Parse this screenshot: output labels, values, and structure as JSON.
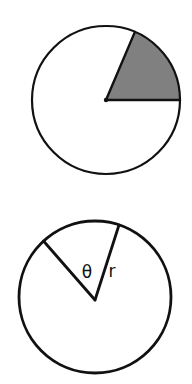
{
  "figure": {
    "background_color": "#ffffff",
    "stroke_color": "#111111",
    "shade_color": "#808080",
    "canvas": {
      "width": 192,
      "height": 384
    }
  },
  "diagrams": [
    {
      "name": "shaded-sector-circle",
      "description": "Circle with one shaded sector in the upper-right",
      "center": {
        "x": 106,
        "y": 100
      },
      "radius": 74,
      "stroke_width": 2.2,
      "sector": {
        "shaded": true,
        "fill_color": "#808080",
        "start_angle_deg": 0,
        "end_angle_deg": 67,
        "sweep_deg": 67,
        "radius_line_1": {
          "x2": 180,
          "y2": 100
        },
        "radius_line_2": {
          "x2": 135,
          "y2": 32
        }
      },
      "labels": []
    },
    {
      "name": "theta-radius-circle",
      "description": "Circle with two radii forming a central angle theta, one radius labelled r",
      "center": {
        "x": 95,
        "y": 297
      },
      "radius": 76,
      "stroke_width": 2.6,
      "sector": {
        "shaded": false,
        "start_angle_deg": 71,
        "end_angle_deg": 131,
        "sweep_deg": 60,
        "radius_line_1": {
          "x2": 120,
          "y2": 225
        },
        "radius_line_2": {
          "x2": 45,
          "y2": 240
        }
      },
      "labels": [
        {
          "id": "theta-label",
          "text": "θ",
          "x": 87,
          "y": 273,
          "font_size": 17
        },
        {
          "id": "radius-label",
          "text": "r",
          "x": 112,
          "y": 272,
          "font_size": 17
        }
      ]
    }
  ]
}
